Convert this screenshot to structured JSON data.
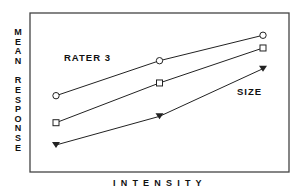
{
  "chart_data": {
    "type": "line",
    "title": "",
    "xlabel": "INTENSITY",
    "ylabel": "MEAN RESPONSE",
    "x": [
      1,
      2,
      3
    ],
    "xticks": [],
    "yticks": [],
    "ylim": [
      0,
      10
    ],
    "xlim": [
      0,
      4
    ],
    "grid": false,
    "legend": "none",
    "annotations": [
      "RATER 3",
      "SIZE"
    ],
    "series": [
      {
        "name": "circle",
        "marker": "open-circle",
        "values": [
          4.8,
          7.0,
          8.6
        ]
      },
      {
        "name": "square",
        "marker": "open-square",
        "values": [
          3.1,
          5.6,
          7.8
        ]
      },
      {
        "name": "triangle",
        "marker": "filled-triangle-down",
        "values": [
          1.7,
          3.5,
          6.5
        ]
      }
    ]
  },
  "labels": {
    "ylabel_word1": [
      "M",
      "E",
      "A",
      "N"
    ],
    "ylabel_word2": [
      "R",
      "E",
      "S",
      "P",
      "O",
      "N",
      "S",
      "E"
    ],
    "xlabel": "INTENSITY",
    "annot_rater": "RATER 3",
    "annot_size": "SIZE"
  },
  "colors": {
    "line": "#222222",
    "frame": "#444444",
    "background": "#ffffff"
  }
}
